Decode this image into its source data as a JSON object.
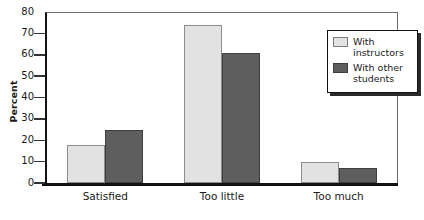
{
  "chart_data": {
    "type": "bar",
    "title": "",
    "subtitle": "",
    "xlabel": "",
    "ylabel": "Percent",
    "categories": [
      "Satisfied",
      "Too little",
      "Too much"
    ],
    "series": [
      {
        "name": "With instructors",
        "values": [
          18,
          74,
          10
        ],
        "color": "#e2e2e2"
      },
      {
        "name": "With other students",
        "values": [
          25,
          61,
          7
        ],
        "color": "#5e5e5e"
      }
    ],
    "ylim": [
      0,
      80
    ],
    "ytick_values": [
      0,
      10,
      20,
      30,
      40,
      50,
      60,
      70,
      80
    ],
    "ytick_labels": [
      "0",
      "10",
      "20",
      "30",
      "40",
      "50",
      "60",
      "70",
      "80"
    ],
    "grid": false,
    "legend_position": "top-right",
    "legend_entries": [
      "With\ninstructors",
      "With other\nstudents"
    ]
  },
  "legend": {
    "entry_1_label": "With\ninstructors",
    "entry_2_label": "With other\nstudents"
  },
  "axis": {
    "y_title": "Percent"
  }
}
